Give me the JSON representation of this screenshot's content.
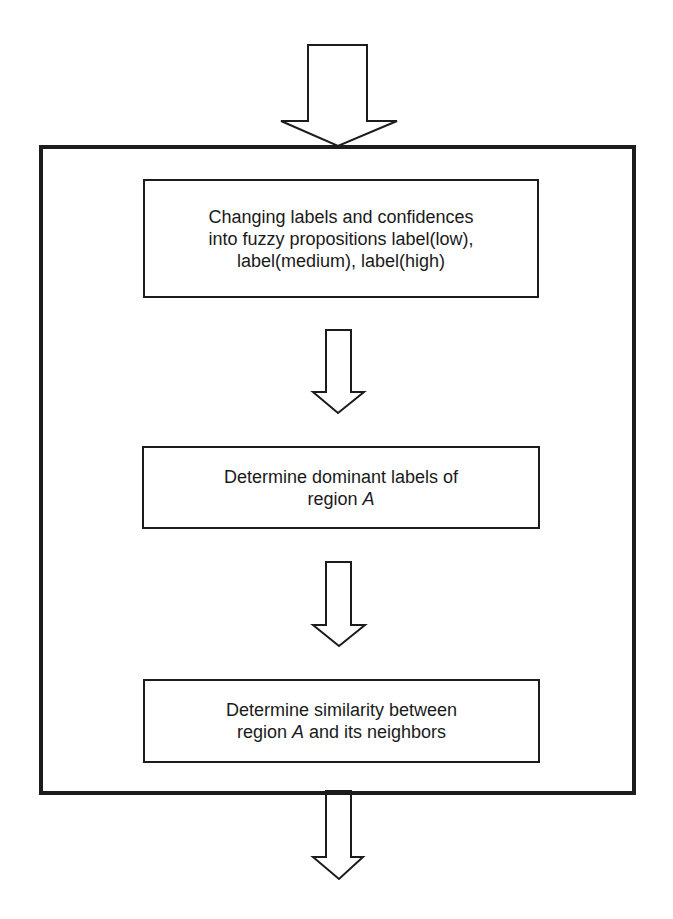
{
  "diagram": {
    "type": "flowchart",
    "colors": {
      "stroke": "#1c1c1c",
      "fill": "#ffffff",
      "text": "#1a1a1a"
    },
    "container": {
      "label": ""
    },
    "steps": [
      {
        "id": "step-1",
        "lines": [
          "Changing labels and confidences",
          "into fuzzy propositions label(low),",
          "label(medium), label(high)"
        ]
      },
      {
        "id": "step-2",
        "lines": [
          "Determine dominant labels of",
          {
            "prefix": "region ",
            "italic": "A",
            "suffix": ""
          }
        ]
      },
      {
        "id": "step-3",
        "lines": [
          "Determine similarity between",
          {
            "prefix": "region ",
            "italic": "A",
            "suffix": " and its neighbors"
          }
        ]
      }
    ],
    "arrows": [
      {
        "id": "input-arrow",
        "from": "external",
        "to": "container"
      },
      {
        "id": "arrow-1-2",
        "from": "step-1",
        "to": "step-2"
      },
      {
        "id": "arrow-2-3",
        "from": "step-2",
        "to": "step-3"
      },
      {
        "id": "output-arrow",
        "from": "container",
        "to": "external"
      }
    ]
  },
  "text": {
    "step1": {
      "line1": "Changing labels and confidences",
      "line2": "into fuzzy propositions label(low),",
      "line3": "label(medium), label(high)"
    },
    "step2": {
      "line1": "Determine dominant labels of",
      "line2_prefix": "region ",
      "line2_italic": "A"
    },
    "step3": {
      "line1": "Determine similarity between",
      "line2_prefix": "region ",
      "line2_italic": "A",
      "line2_suffix": " and its neighbors"
    }
  }
}
